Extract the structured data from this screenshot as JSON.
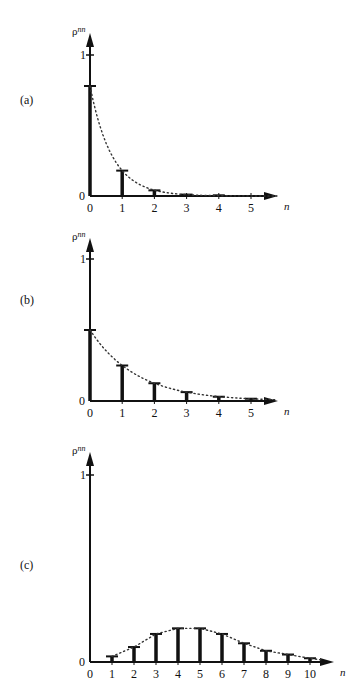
{
  "header": {
    "text": ""
  },
  "panels": [
    {
      "label": "(a)",
      "ylabel": "ρnn",
      "ytick_top": "1",
      "ytick_zero": "0",
      "xlabel": "n"
    },
    {
      "label": "(b)",
      "ylabel": "ρnn",
      "ytick_top": "1",
      "ytick_zero": "0",
      "xlabel": "n"
    },
    {
      "label": "(c)",
      "ylabel": "ρnn",
      "ytick_top": "1",
      "ytick_zero": "0",
      "xlabel": "n"
    }
  ],
  "colors": {
    "ink": "#111111",
    "background": "#ffffff"
  },
  "chart_data": [
    {
      "type": "bar",
      "title": "(a)",
      "xlabel": "n",
      "ylabel": "ρ^nn",
      "categories": [
        0,
        1,
        2,
        3,
        4,
        5
      ],
      "values": [
        0.78,
        0.18,
        0.04,
        0.01,
        0.005,
        0.0
      ],
      "envelope": "dotted exponential decay curve",
      "ylim": [
        0,
        1
      ],
      "yticks": [
        0,
        1
      ],
      "grid": false,
      "legend": null
    },
    {
      "type": "bar",
      "title": "(b)",
      "xlabel": "n",
      "ylabel": "ρ^nn",
      "categories": [
        0,
        1,
        2,
        3,
        4,
        5
      ],
      "values": [
        0.5,
        0.25,
        0.125,
        0.0625,
        0.03,
        0.016
      ],
      "envelope": "dotted exponential decay curve",
      "ylim": [
        0,
        1
      ],
      "yticks": [
        0,
        1
      ],
      "grid": false,
      "legend": null
    },
    {
      "type": "bar",
      "title": "(c)",
      "xlabel": "n",
      "ylabel": "ρ^nn",
      "categories": [
        0,
        1,
        2,
        3,
        4,
        5,
        6,
        7,
        8,
        9,
        10
      ],
      "values": [
        0.0,
        0.03,
        0.08,
        0.15,
        0.18,
        0.18,
        0.15,
        0.1,
        0.06,
        0.04,
        0.02
      ],
      "envelope": "dotted Poisson-like curve",
      "ylim": [
        0,
        1
      ],
      "yticks": [
        0,
        1
      ],
      "grid": false,
      "legend": null
    }
  ]
}
